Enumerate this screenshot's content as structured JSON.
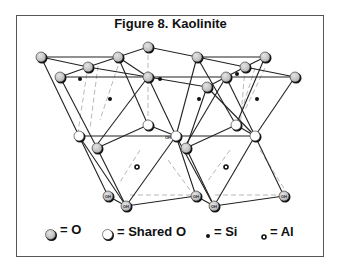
{
  "figure": {
    "title": "Figure 8. Kaolinite",
    "atom_label": "OH"
  },
  "legend": {
    "items": [
      {
        "symbol": "grey-sphere",
        "label": "= O"
      },
      {
        "symbol": "white-sphere",
        "label": "= Shared O"
      },
      {
        "symbol": "small-dot",
        "label": "= Si"
      },
      {
        "symbol": "small-ring",
        "label": "= Al"
      }
    ]
  },
  "colors": {
    "oxygen": "#c8c8c8",
    "shared_oxygen": "#ffffff",
    "line": "#222222",
    "dashed": "#999999"
  }
}
